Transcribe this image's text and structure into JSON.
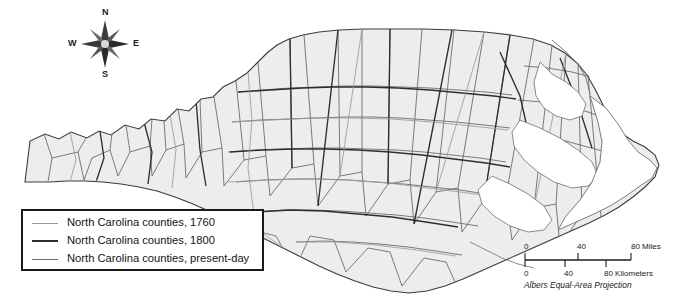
{
  "map": {
    "subject": "North Carolina",
    "background_color": "#ffffff",
    "county_fill_color": "#ededed",
    "county_border_color": "#5a5a5a",
    "state_border_color": "#3c3c3c"
  },
  "compass": {
    "name": "compass-rose",
    "north": "N",
    "south": "S",
    "east": "E",
    "west": "W"
  },
  "legend": {
    "entries": [
      {
        "label": "North Carolina counties, 1760",
        "color": "#9a9a9a",
        "weight": "1px"
      },
      {
        "label": "North Carolina counties, 1800",
        "color": "#2e2e2e",
        "weight": "2px"
      },
      {
        "label": "North Carolina counties, present-day",
        "color": "#6d6d6d",
        "weight": "1.5px"
      }
    ]
  },
  "scale_bar": {
    "miles": {
      "units_label": "80 Miles",
      "ticks": [
        "0",
        "40"
      ]
    },
    "kilometers": {
      "units_label": "80 Kilometers",
      "ticks": [
        "0",
        "40"
      ]
    },
    "projection": "Albers Equal-Area Projection"
  }
}
